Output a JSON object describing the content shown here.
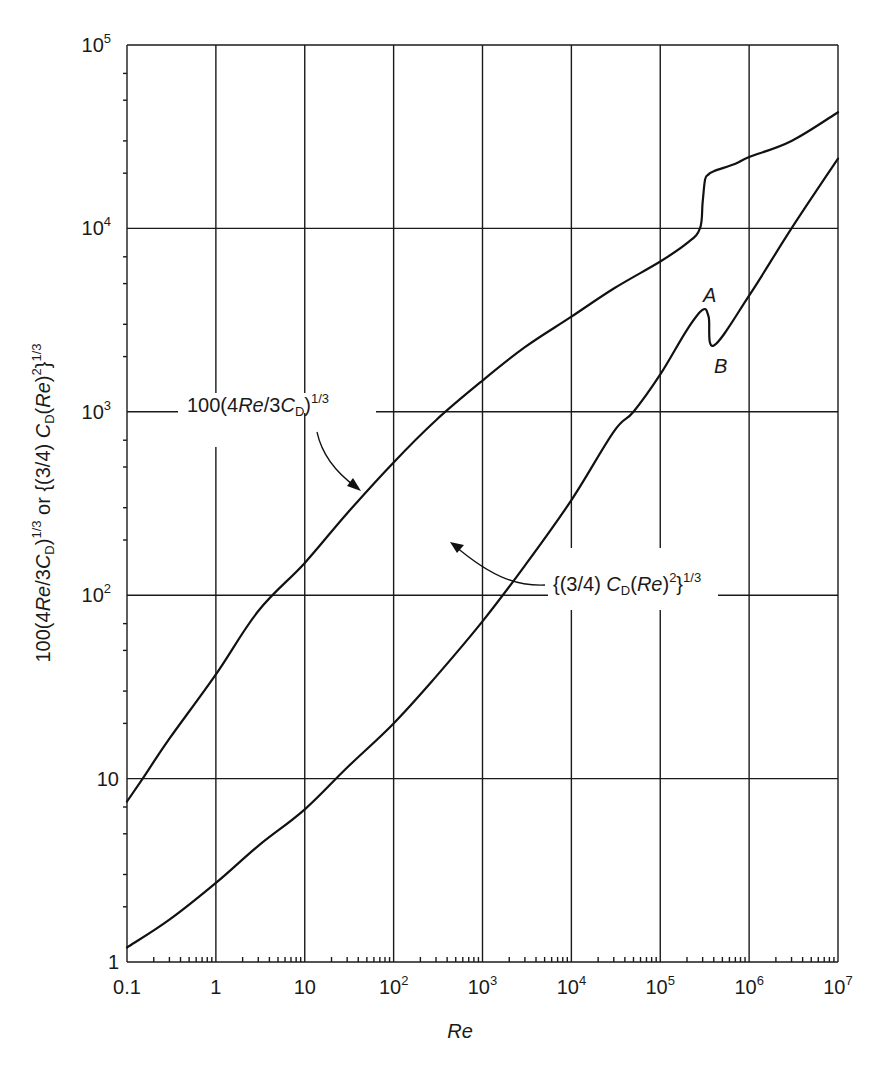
{
  "chart_data": {
    "type": "line",
    "title": "",
    "xlabel": "Re",
    "ylabel": "100(4Re/3C_D)^(1/3) or {(3/4) C_D (Re)^2}^(1/3)",
    "xscale": "log",
    "yscale": "log",
    "xlim": [
      0.1,
      10000000
    ],
    "ylim": [
      1,
      100000
    ],
    "grid": true,
    "x_tick_labels": [
      "0.1",
      "1",
      "10",
      "10^2",
      "10^3",
      "10^4",
      "10^5",
      "10^6",
      "10^7"
    ],
    "y_tick_labels": [
      "1",
      "10",
      "10^2",
      "10^3",
      "10^4",
      "10^5"
    ],
    "series": [
      {
        "name": "100(4Re/3C_D)^1/3",
        "x": [
          0.1,
          0.15,
          0.3,
          1,
          3,
          10,
          30,
          100,
          300,
          1000,
          3000,
          10000,
          30000,
          100000,
          200000,
          280000,
          300000,
          320000,
          350000,
          400000,
          700000,
          1000000,
          3000000,
          10000000
        ],
        "y": [
          7.5,
          10,
          16.5,
          37,
          82,
          150,
          280,
          530,
          900,
          1480,
          2250,
          3300,
          4700,
          6600,
          8300,
          10000,
          14000,
          18500,
          19700,
          20500,
          22500,
          24500,
          30000,
          43000
        ]
      },
      {
        "name": "{(3/4) C_D (Re)^2}^1/3",
        "x": [
          0.1,
          0.3,
          1,
          3,
          10,
          30,
          100,
          300,
          1000,
          3000,
          10000,
          30000,
          50000,
          100000,
          200000,
          300000,
          350000,
          400000,
          1000000,
          3000000,
          10000000
        ],
        "y": [
          1.2,
          1.7,
          2.7,
          4.3,
          6.8,
          11.5,
          20,
          36,
          72,
          145,
          330,
          780,
          1000,
          1600,
          2800,
          3600,
          3300,
          2300,
          4300,
          10000,
          24000
        ]
      }
    ],
    "annotations": [
      {
        "text": "100(4Re/3C_D)^1/3",
        "points_to": "upper curve near Re=40"
      },
      {
        "text": "{(3/4) C_D (Re)^2}^1/3",
        "points_to": "lower curve near Re=1.5x10^3"
      },
      {
        "text": "A",
        "at": "local maximum of lower curve near Re=3x10^5"
      },
      {
        "text": "B",
        "at": "local minimum of lower curve near Re=4x10^5"
      }
    ]
  },
  "labels": {
    "x_axis": "Re",
    "y_axis": {
      "p1": "100(4",
      "p2": "Re",
      "p3": "/3",
      "p4": "C",
      "p5": "D",
      "p6": ")",
      "p7": "1/3",
      "p8": " or {(3/4) ",
      "p9": "C",
      "p10": "D",
      "p11": "(",
      "p12": "Re",
      "p13": ")",
      "p14": "2",
      "p15": "}",
      "p16": "1/3"
    },
    "upper_annotation": {
      "a": "100(4",
      "b": "Re",
      "c": "/3",
      "d": "C",
      "e": "D",
      "f": ")",
      "g": "1/3"
    },
    "lower_annotation": {
      "a": "{(3/4) ",
      "b": "C",
      "c": "D",
      "d": "(",
      "e": "Re",
      "f": ")",
      "g": "2",
      "h": "}",
      "i": "1/3"
    },
    "point_a": "A",
    "point_b": "B",
    "x_ticks": [
      {
        "base": "0.1",
        "exp": ""
      },
      {
        "base": "1",
        "exp": ""
      },
      {
        "base": "10",
        "exp": ""
      },
      {
        "base": "10",
        "exp": "2"
      },
      {
        "base": "10",
        "exp": "3"
      },
      {
        "base": "10",
        "exp": "4"
      },
      {
        "base": "10",
        "exp": "5"
      },
      {
        "base": "10",
        "exp": "6"
      },
      {
        "base": "10",
        "exp": "7"
      }
    ],
    "y_ticks": [
      {
        "base": "1",
        "exp": ""
      },
      {
        "base": "10",
        "exp": ""
      },
      {
        "base": "10",
        "exp": "2"
      },
      {
        "base": "10",
        "exp": "3"
      },
      {
        "base": "10",
        "exp": "4"
      },
      {
        "base": "10",
        "exp": "5"
      }
    ]
  }
}
